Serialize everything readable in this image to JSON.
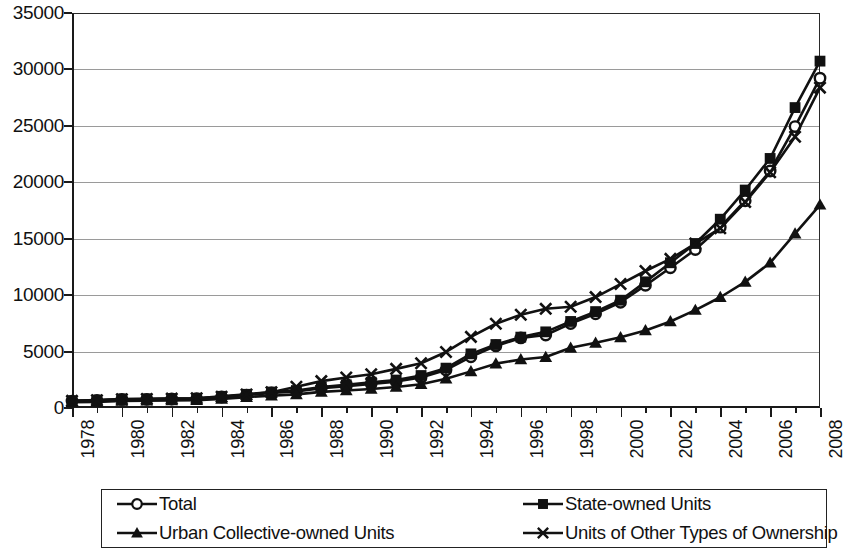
{
  "chart_data": {
    "type": "line",
    "title": "",
    "xlabel": "",
    "ylabel": "",
    "xlim": [
      1978,
      2008
    ],
    "ylim": [
      0,
      35000
    ],
    "ytick_interval": 5000,
    "xtick_label_interval": 2,
    "grid": true,
    "legend_position": "bottom",
    "yticks": [
      "0",
      "5000",
      "10000",
      "15000",
      "20000",
      "25000",
      "30000",
      "35000"
    ],
    "ytick_values": [
      0,
      5000,
      10000,
      15000,
      20000,
      25000,
      30000,
      35000
    ],
    "x": [
      1978,
      1979,
      1980,
      1981,
      1982,
      1983,
      1984,
      1985,
      1986,
      1987,
      1988,
      1989,
      1990,
      1991,
      1992,
      1993,
      1994,
      1995,
      1996,
      1997,
      1998,
      1999,
      2000,
      2001,
      2002,
      2003,
      2004,
      2005,
      2006,
      2007,
      2008
    ],
    "xtick_labels": [
      "1978",
      "1980",
      "1982",
      "1984",
      "1986",
      "1988",
      "1990",
      "1992",
      "1994",
      "1996",
      "1998",
      "2000",
      "2002",
      "2004",
      "2006",
      "2008"
    ],
    "series": [
      {
        "name": "Total",
        "marker": "open-circle",
        "values": [
          615,
          668,
          762,
          772,
          798,
          826,
          974,
          1148,
          1329,
          1459,
          1747,
          1935,
          2140,
          2340,
          2711,
          3371,
          4538,
          5500,
          6210,
          6470,
          7479,
          8346,
          9371,
          10870,
          12422,
          14040,
          16024,
          18364,
          21001,
          24932,
          29229
        ]
      },
      {
        "name": "State-owned Units",
        "marker": "filled-square",
        "values": [
          644,
          705,
          803,
          812,
          836,
          865,
          1034,
          1213,
          1414,
          1546,
          1853,
          2055,
          2284,
          2477,
          2878,
          3532,
          4797,
          5625,
          6280,
          6747,
          7668,
          8543,
          9552,
          11178,
          12869,
          14577,
          16729,
          19313,
          22112,
          26620,
          30736
        ]
      },
      {
        "name": "Urban Collective-owned Units",
        "marker": "filled-triangle",
        "values": [
          506,
          542,
          623,
          642,
          671,
          698,
          811,
          967,
          1092,
          1207,
          1426,
          1557,
          1681,
          1866,
          2109,
          2592,
          3245,
          3931,
          4302,
          4512,
          5331,
          5774,
          6262,
          6867,
          7667,
          8678,
          9814,
          11176,
          12866,
          15444,
          18006
        ]
      },
      {
        "name": "Units of Other Types of Ownership",
        "marker": "x-cross",
        "values": [
          632,
          690,
          780,
          800,
          830,
          860,
          1000,
          1200,
          1400,
          1879,
          2382,
          2707,
          2987,
          3468,
          3966,
          4966,
          6303,
          7463,
          8261,
          8789,
          8972,
          9829,
          10984,
          12140,
          13212,
          14574,
          15928,
          18244,
          20883,
          24035,
          28387
        ]
      }
    ]
  },
  "legend": {
    "items": [
      {
        "label": "Total",
        "marker": "open-circle"
      },
      {
        "label": "State-owned Units",
        "marker": "filled-square"
      },
      {
        "label": "Urban Collective-owned Units",
        "marker": "filled-triangle"
      },
      {
        "label": "Units of Other Types of Ownership",
        "marker": "x-cross"
      }
    ]
  },
  "colors": {
    "series_stroke": "#111111",
    "gridline": "#9a9a9a",
    "axis": "#1a1a1a",
    "background": "#ffffff"
  }
}
